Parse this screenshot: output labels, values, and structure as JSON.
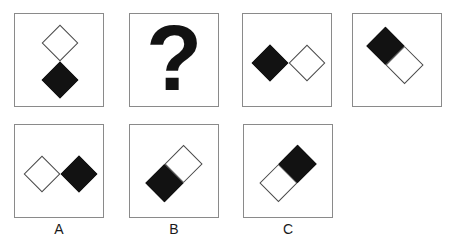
{
  "puzzle": {
    "description": "shape sequence puzzle with question mark and answer options",
    "top_row": [
      {
        "name": "stimulus-1",
        "figure": {
          "type": "diamond-pair",
          "orientation": "vertical",
          "first_color": "white",
          "second_color": "black"
        }
      },
      {
        "name": "question-cell",
        "figure": {
          "type": "question-mark",
          "glyph": "?"
        }
      },
      {
        "name": "stimulus-2",
        "figure": {
          "type": "diamond-pair",
          "orientation": "horizontal",
          "first_color": "black",
          "second_color": "white"
        }
      },
      {
        "name": "stimulus-3",
        "figure": {
          "type": "split-domino",
          "diagonal": "falling",
          "first_color": "black",
          "second_color": "white"
        }
      }
    ],
    "answers": [
      {
        "label": "A",
        "figure": {
          "type": "diamond-pair",
          "orientation": "horizontal",
          "first_color": "white",
          "second_color": "black"
        }
      },
      {
        "label": "B",
        "figure": {
          "type": "split-domino",
          "diagonal": "rising",
          "first_color": "black",
          "second_color": "white"
        }
      },
      {
        "label": "C",
        "figure": {
          "type": "split-domino",
          "diagonal": "rising",
          "first_color": "white",
          "second_color": "black"
        }
      }
    ],
    "colors": {
      "shape_black": "#121212",
      "shape_outline": "#4a4a4a",
      "box_border": "#8a8a8a"
    }
  }
}
